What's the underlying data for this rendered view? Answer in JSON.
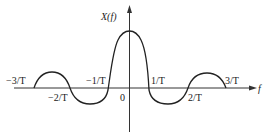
{
  "diagram": {
    "type": "sinc-spectrum",
    "y_axis_label": "X(f)",
    "x_axis_label": "f",
    "origin_label": "0",
    "tick_labels": [
      {
        "id": "neg3",
        "text": "−3/T"
      },
      {
        "id": "neg2",
        "text": "−2/T"
      },
      {
        "id": "neg1",
        "text": "−1/T"
      },
      {
        "id": "pos1",
        "text": "1/T"
      },
      {
        "id": "pos2",
        "text": "2/T"
      },
      {
        "id": "pos3",
        "text": "3/T"
      }
    ],
    "zero_crossings": [
      "-3/T",
      "-2/T",
      "-1/T",
      "1/T",
      "2/T",
      "3/T"
    ],
    "line_color": "#222222"
  }
}
